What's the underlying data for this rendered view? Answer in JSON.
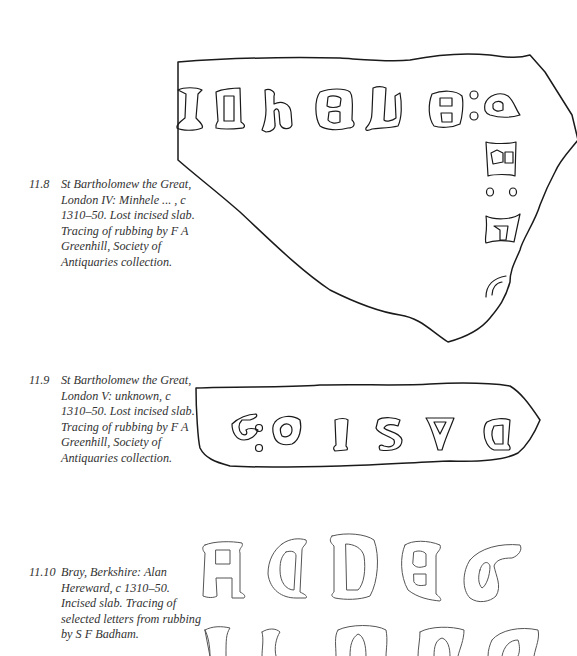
{
  "page": {
    "running_head": "EARLY INSCRIBED SLABS AND THE TRANSITION TO LOMBARDIC"
  },
  "figures": [
    {
      "id": "11.8",
      "number_label": "11.8",
      "caption": "St Bartholomew the Great, London IV: Minhele ... , c 1310–50. Lost incised slab. Tracing of rubbing by F A Greenhill, Society of Antiquaries collection.",
      "letters": [
        "I",
        "N",
        "h",
        "E",
        "L",
        "E",
        ":",
        "A",
        "B",
        ":",
        "E",
        "A"
      ]
    },
    {
      "id": "11.9",
      "number_label": "11.9",
      "caption": "St Bartholomew the Great, London V: unknown, c 1310–50. Lost incised slab. Tracing of rubbing by F A Greenhill, Society of Antiquaries collection.",
      "letters": [
        "G",
        ":",
        "G",
        "I",
        "S",
        "V",
        "D"
      ]
    },
    {
      "id": "11.10",
      "number_label": "11.10",
      "caption": "Bray, Berkshire: Alan Hereward, c 1310–50. Incised slab. Tracing of selected letters from rubbing by S F Badham.",
      "letters_row1": [
        "A",
        "A",
        "D",
        "E",
        "G"
      ],
      "letters_row2": [
        "I",
        "L",
        "M",
        "N",
        "O"
      ]
    }
  ]
}
